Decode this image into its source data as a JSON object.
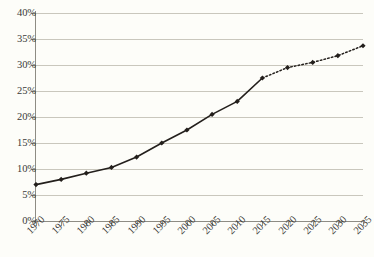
{
  "chart_data": {
    "type": "line",
    "title": "",
    "xlabel": "",
    "ylabel": "",
    "xlim": [
      1970,
      2035
    ],
    "ylim": [
      0,
      40
    ],
    "grid": true,
    "legend": null,
    "y_ticks": [
      "0%",
      "5%",
      "10%",
      "15%",
      "20%",
      "25%",
      "30%",
      "35%",
      "40%"
    ],
    "y_tick_values": [
      0,
      5,
      10,
      15,
      20,
      25,
      30,
      35,
      40
    ],
    "x_ticks": [
      "1970",
      "1975",
      "1980",
      "1985",
      "1990",
      "1995",
      "2000",
      "2005",
      "2010",
      "2015",
      "2020",
      "2025",
      "2030",
      "2035"
    ],
    "x_tick_values": [
      1970,
      1975,
      1980,
      1985,
      1990,
      1995,
      2000,
      2005,
      2010,
      2015,
      2020,
      2025,
      2030,
      2035
    ],
    "x": [
      1970,
      1975,
      1980,
      1985,
      1990,
      1995,
      2000,
      2005,
      2010,
      2015,
      2020,
      2025,
      2030,
      2035
    ],
    "values": [
      7.0,
      8.0,
      9.2,
      10.3,
      12.3,
      15.0,
      17.5,
      20.5,
      23.0,
      27.5,
      29.5,
      30.5,
      31.8,
      33.7
    ],
    "series": [
      {
        "name": "historical",
        "style": "solid",
        "x": [
          1970,
          1975,
          1980,
          1985,
          1990,
          1995,
          2000,
          2005,
          2010,
          2015
        ],
        "values": [
          7.0,
          8.0,
          9.2,
          10.3,
          12.3,
          15.0,
          17.5,
          20.5,
          23.0,
          27.5
        ]
      },
      {
        "name": "projected",
        "style": "dotted",
        "x": [
          2015,
          2020,
          2025,
          2030,
          2035
        ],
        "values": [
          27.5,
          29.5,
          30.5,
          31.8,
          33.7
        ]
      }
    ],
    "marker": "diamond",
    "line_color": "#231f1c",
    "grid_color": "#c9c7bd",
    "axis_color": "#8e8c84",
    "background_color": "#fdfdf9"
  }
}
